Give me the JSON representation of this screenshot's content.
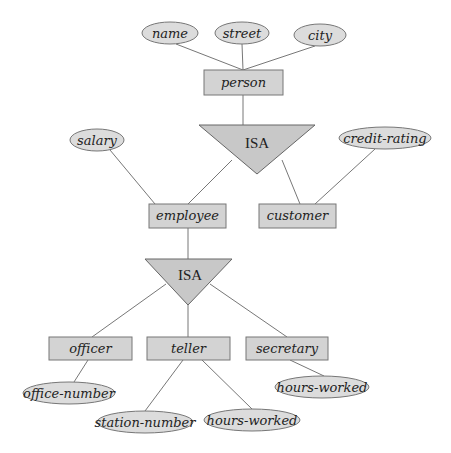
{
  "diagram": {
    "type": "E-R specialization hierarchy",
    "entities": {
      "person": "person",
      "employee": "employee",
      "customer": "customer",
      "officer": "officer",
      "teller": "teller",
      "secretary": "secretary"
    },
    "attributes": {
      "name": "name",
      "street": "street",
      "city": "city",
      "salary": "salary",
      "credit_rating": "credit-rating",
      "office_number": "office-number",
      "station_number": "station-number",
      "teller_hours_worked": "hours-worked",
      "secretary_hours_worked": "hours-worked"
    },
    "isa": {
      "top": "ISA",
      "bottom": "ISA"
    },
    "colors": {
      "fill": "#d3d3d3",
      "stroke": "#777777",
      "background": "#ffffff"
    }
  }
}
